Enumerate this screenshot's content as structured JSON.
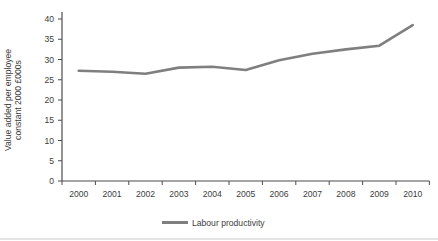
{
  "chart": {
    "legend_label": "Labour productivity",
    "ylabel_line1": "Value added per employee",
    "ylabel_line2": "constant 2000 £000s",
    "line_color": "#7f7f7f",
    "axis_color": "#4d4d4d",
    "text_color": "#3d3d3d",
    "border_color": "#c9c9c9"
  },
  "chart_data": {
    "type": "line",
    "title": "",
    "xlabel": "",
    "ylabel": "Value added per employee constant 2000 £000s",
    "categories": [
      "2000",
      "2001",
      "2002",
      "2003",
      "2004",
      "2005",
      "2006",
      "2007",
      "2008",
      "2009",
      "2010"
    ],
    "series": [
      {
        "name": "Labour productivity",
        "color": "#7f7f7f",
        "values": [
          27.2,
          27.0,
          26.5,
          28.0,
          28.2,
          27.4,
          29.8,
          31.4,
          32.5,
          33.4,
          38.5
        ]
      }
    ],
    "ylim": [
      0,
      40
    ],
    "ytick_step": 5,
    "grid": false,
    "legend_position": "bottom"
  }
}
